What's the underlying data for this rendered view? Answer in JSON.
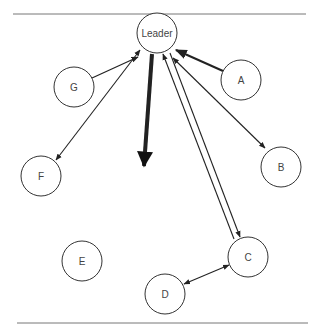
{
  "diagram": {
    "nodes": [
      {
        "id": "leader",
        "label": "Leader",
        "cx": 157,
        "cy": 33,
        "r": 20
      },
      {
        "id": "a",
        "label": "A",
        "cx": 241,
        "cy": 80,
        "r": 20
      },
      {
        "id": "b",
        "label": "B",
        "cx": 281,
        "cy": 167,
        "r": 20
      },
      {
        "id": "c",
        "label": "C",
        "cx": 248,
        "cy": 257,
        "r": 20
      },
      {
        "id": "d",
        "label": "D",
        "cx": 165,
        "cy": 294,
        "r": 20
      },
      {
        "id": "e",
        "label": "E",
        "cx": 82,
        "cy": 261,
        "r": 20
      },
      {
        "id": "f",
        "label": "F",
        "cx": 41,
        "cy": 176,
        "r": 20
      },
      {
        "id": "g",
        "label": "G",
        "cx": 74,
        "cy": 87,
        "r": 20
      }
    ],
    "edges": [
      {
        "from": "g",
        "to": "leader",
        "type": "one-way",
        "weight": "normal"
      },
      {
        "from": "leader",
        "to": "f",
        "type": "two-way",
        "weight": "normal"
      },
      {
        "from": "a",
        "to": "leader",
        "type": "one-way",
        "weight": "medium"
      },
      {
        "from": "leader",
        "to": "b",
        "type": "two-way",
        "weight": "normal"
      },
      {
        "from": "c",
        "to": "leader",
        "type": "parallel-pair",
        "weight": "normal"
      },
      {
        "from": "c",
        "to": "d",
        "type": "two-way",
        "weight": "normal"
      },
      {
        "from": "leader",
        "to": "open-space",
        "type": "one-way",
        "weight": "heavy"
      }
    ]
  }
}
